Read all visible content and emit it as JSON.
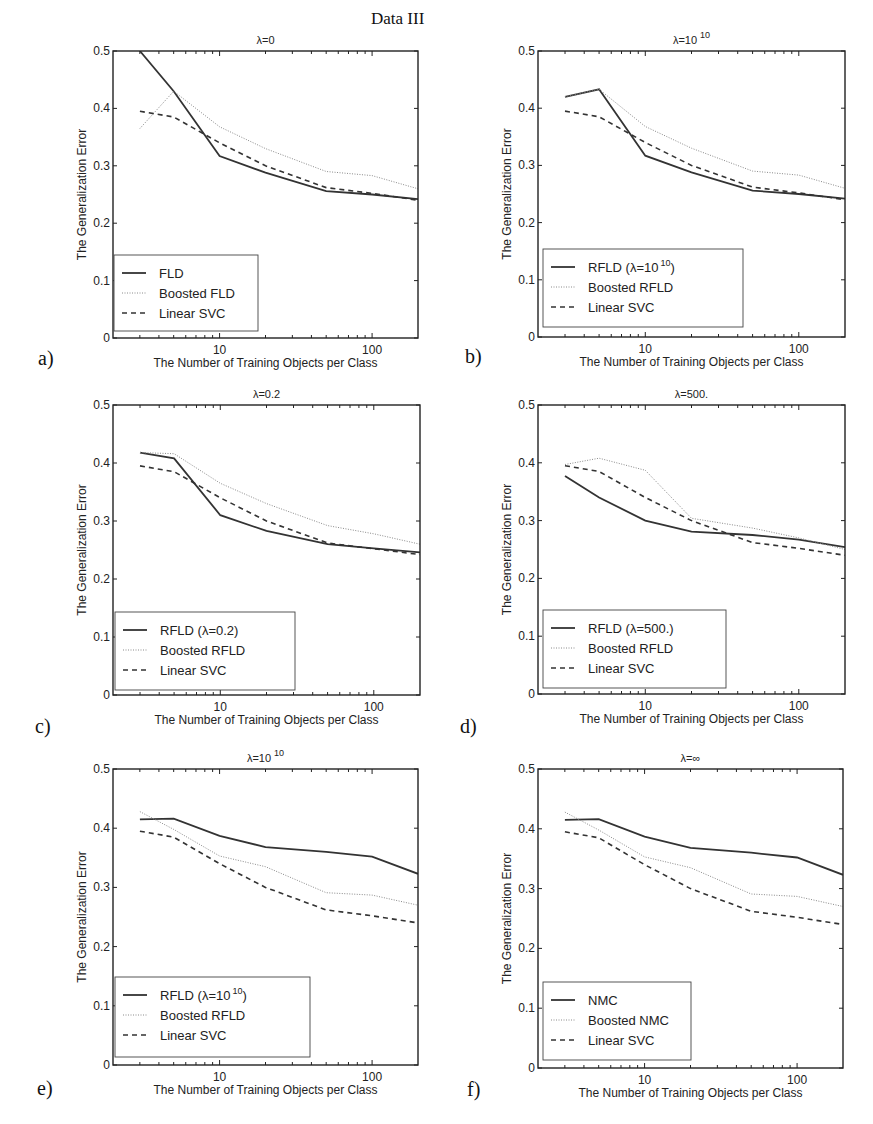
{
  "figure": {
    "title": "Data III",
    "panels": [
      "a)",
      "b)",
      "c)",
      "d)",
      "e)",
      "f)"
    ]
  },
  "styles": {
    "solid": {
      "color": "#333333",
      "width": 1.8,
      "dash": ""
    },
    "dotted": {
      "color": "#8a8a8a",
      "width": 1.0,
      "dash": "1,1.5"
    },
    "dashed": {
      "color": "#333333",
      "width": 1.6,
      "dash": "5,4"
    }
  },
  "chart_data": [
    {
      "panel": "a)",
      "type": "line",
      "title": "λ=0",
      "title_sup": "",
      "xlabel": "The Number of Training Objects per Class",
      "ylabel": "The Generalization Error",
      "xscale": "log",
      "xlim": [
        2,
        200
      ],
      "ylim": [
        0,
        0.5
      ],
      "xticks": [
        10,
        100
      ],
      "yticks": [
        0,
        0.1,
        0.2,
        0.3,
        0.4,
        0.5
      ],
      "x": [
        3,
        5,
        10,
        20,
        50,
        100,
        200
      ],
      "series": [
        {
          "name": "FLD",
          "style": "solid",
          "values": [
            0.5,
            0.43,
            0.317,
            0.288,
            0.256,
            0.25,
            0.242
          ]
        },
        {
          "name": "Boosted FLD",
          "style": "dotted",
          "values": [
            0.365,
            0.43,
            0.368,
            0.33,
            0.29,
            0.283,
            0.26
          ]
        },
        {
          "name": "Linear SVC",
          "style": "dashed",
          "values": [
            0.395,
            0.385,
            0.34,
            0.3,
            0.262,
            0.252,
            0.24
          ]
        }
      ],
      "legend": {
        "position": "lower left",
        "labels": [
          "FLD",
          "Boosted FLD",
          "Linear SVC"
        ]
      },
      "box": {
        "left": 113,
        "top": 51,
        "right": 418,
        "bottom": 338
      },
      "legend_box": {
        "x": 114,
        "y": 255,
        "w": 144,
        "h": 76
      }
    },
    {
      "panel": "b)",
      "type": "line",
      "title": "λ=10",
      "title_sup": "10",
      "xlabel": "The Number of Training Objects per Class",
      "ylabel": "The Generalization Error",
      "xscale": "log",
      "xlim": [
        2,
        200
      ],
      "ylim": [
        0,
        0.5
      ],
      "xticks": [
        10,
        100
      ],
      "yticks": [
        0,
        0.1,
        0.2,
        0.3,
        0.4,
        0.5
      ],
      "x": [
        3,
        5,
        10,
        20,
        50,
        100,
        200
      ],
      "series": [
        {
          "name": "RFLD (λ=10^10)",
          "style": "solid",
          "values": [
            0.42,
            0.433,
            0.317,
            0.288,
            0.256,
            0.25,
            0.242
          ]
        },
        {
          "name": "Boosted RFLD",
          "style": "dotted",
          "values": [
            0.42,
            0.433,
            0.368,
            0.33,
            0.29,
            0.283,
            0.26
          ]
        },
        {
          "name": "Linear SVC",
          "style": "dashed",
          "values": [
            0.395,
            0.385,
            0.34,
            0.3,
            0.262,
            0.252,
            0.24
          ]
        }
      ],
      "legend": {
        "position": "lower left",
        "labels": [
          "RFLD (λ=10",
          "Boosted RFLD",
          "Linear SVC"
        ],
        "sup": [
          "10",
          "",
          ""
        ],
        "suffix": [
          ")",
          "",
          ""
        ]
      },
      "box": {
        "left": 538,
        "top": 51,
        "right": 845,
        "bottom": 337
      },
      "legend_box": {
        "x": 543,
        "y": 249,
        "w": 200,
        "h": 78
      }
    },
    {
      "panel": "c)",
      "type": "line",
      "title": "λ=0.2",
      "title_sup": "",
      "xlabel": "The Number of Training Objects per Class",
      "ylabel": "The Generalization Error",
      "xscale": "log",
      "xlim": [
        2,
        200
      ],
      "ylim": [
        0,
        0.5
      ],
      "xticks": [
        10,
        100
      ],
      "yticks": [
        0,
        0.1,
        0.2,
        0.3,
        0.4,
        0.5
      ],
      "x": [
        3,
        5,
        10,
        20,
        50,
        100,
        200
      ],
      "series": [
        {
          "name": "RFLD (λ=0.2)",
          "style": "solid",
          "values": [
            0.418,
            0.408,
            0.31,
            0.283,
            0.26,
            0.253,
            0.246
          ]
        },
        {
          "name": "Boosted RFLD",
          "style": "dotted",
          "values": [
            0.418,
            0.416,
            0.365,
            0.33,
            0.292,
            0.278,
            0.26
          ]
        },
        {
          "name": "Linear SVC",
          "style": "dashed",
          "values": [
            0.395,
            0.385,
            0.34,
            0.3,
            0.262,
            0.252,
            0.242
          ]
        }
      ],
      "legend": {
        "position": "lower left",
        "labels": [
          "RFLD (λ=0.2)",
          "Boosted RFLD",
          "Linear SVC"
        ]
      },
      "box": {
        "left": 113,
        "top": 405,
        "right": 420,
        "bottom": 695
      },
      "legend_box": {
        "x": 115,
        "y": 612,
        "w": 180,
        "h": 78
      }
    },
    {
      "panel": "d)",
      "type": "line",
      "title": "λ=500.",
      "title_sup": "",
      "xlabel": "The Number of Training Objects per Class",
      "ylabel": "The Generalization Error",
      "xscale": "log",
      "xlim": [
        2,
        200
      ],
      "ylim": [
        0,
        0.5
      ],
      "xticks": [
        10,
        100
      ],
      "yticks": [
        0,
        0.1,
        0.2,
        0.3,
        0.4,
        0.5
      ],
      "x": [
        3,
        5,
        10,
        20,
        50,
        100,
        200
      ],
      "series": [
        {
          "name": "RFLD (λ=500.)",
          "style": "solid",
          "values": [
            0.377,
            0.34,
            0.3,
            0.281,
            0.275,
            0.267,
            0.254
          ]
        },
        {
          "name": "Boosted RFLD",
          "style": "dotted",
          "values": [
            0.397,
            0.408,
            0.387,
            0.304,
            0.287,
            0.27,
            0.25
          ]
        },
        {
          "name": "Linear SVC",
          "style": "dashed",
          "values": [
            0.395,
            0.385,
            0.34,
            0.3,
            0.262,
            0.252,
            0.24
          ]
        }
      ],
      "legend": {
        "position": "lower left",
        "labels": [
          "RFLD (λ=500.)",
          "Boosted RFLD",
          "Linear SVC"
        ]
      },
      "box": {
        "left": 538,
        "top": 405,
        "right": 845,
        "bottom": 694
      },
      "legend_box": {
        "x": 543,
        "y": 610,
        "w": 183,
        "h": 78
      }
    },
    {
      "panel": "e)",
      "type": "line",
      "title": "λ=10",
      "title_sup": "10",
      "xlabel": "The Number of Training Objects per Class",
      "ylabel": "The Generalization Error",
      "xscale": "log",
      "xlim": [
        2,
        200
      ],
      "ylim": [
        0,
        0.5
      ],
      "xticks": [
        10,
        100
      ],
      "yticks": [
        0,
        0.1,
        0.2,
        0.3,
        0.4,
        0.5
      ],
      "x": [
        3,
        5,
        10,
        20,
        50,
        100,
        200
      ],
      "series": [
        {
          "name": "RFLD (λ=10^10)",
          "style": "solid",
          "values": [
            0.415,
            0.416,
            0.387,
            0.368,
            0.36,
            0.352,
            0.323
          ]
        },
        {
          "name": "Boosted RFLD",
          "style": "dotted",
          "values": [
            0.428,
            0.398,
            0.353,
            0.335,
            0.291,
            0.287,
            0.27
          ]
        },
        {
          "name": "Linear SVC",
          "style": "dashed",
          "values": [
            0.395,
            0.385,
            0.34,
            0.3,
            0.262,
            0.252,
            0.24
          ]
        }
      ],
      "legend": {
        "position": "lower left",
        "labels": [
          "RFLD (λ=10",
          "Boosted RFLD",
          "Linear SVC"
        ],
        "sup": [
          "10",
          "",
          ""
        ],
        "suffix": [
          ")",
          "",
          ""
        ]
      },
      "box": {
        "left": 113,
        "top": 769,
        "right": 418,
        "bottom": 1065
      },
      "legend_box": {
        "x": 115,
        "y": 977,
        "w": 195,
        "h": 80
      }
    },
    {
      "panel": "f)",
      "type": "line",
      "title": "λ=∞",
      "title_sup": "",
      "xlabel": "The Number of Training Objects per Class",
      "ylabel": "The Generalization Error",
      "xscale": "log",
      "xlim": [
        2,
        200
      ],
      "ylim": [
        0,
        0.5
      ],
      "xticks": [
        10,
        100
      ],
      "yticks": [
        0,
        0.1,
        0.2,
        0.3,
        0.4,
        0.5
      ],
      "x": [
        3,
        5,
        10,
        20,
        50,
        100,
        200
      ],
      "series": [
        {
          "name": "NMC",
          "style": "solid",
          "values": [
            0.415,
            0.416,
            0.387,
            0.368,
            0.36,
            0.352,
            0.323
          ]
        },
        {
          "name": "Boosted NMC",
          "style": "dotted",
          "values": [
            0.428,
            0.398,
            0.353,
            0.335,
            0.291,
            0.287,
            0.27
          ]
        },
        {
          "name": "Linear SVC",
          "style": "dashed",
          "values": [
            0.395,
            0.385,
            0.34,
            0.3,
            0.262,
            0.252,
            0.24
          ]
        }
      ],
      "legend": {
        "position": "lower left",
        "labels": [
          "NMC",
          "Boosted NMC",
          "Linear SVC"
        ]
      },
      "box": {
        "left": 538,
        "top": 769,
        "right": 843,
        "bottom": 1068
      },
      "legend_box": {
        "x": 543,
        "y": 982,
        "w": 148,
        "h": 78
      }
    }
  ]
}
